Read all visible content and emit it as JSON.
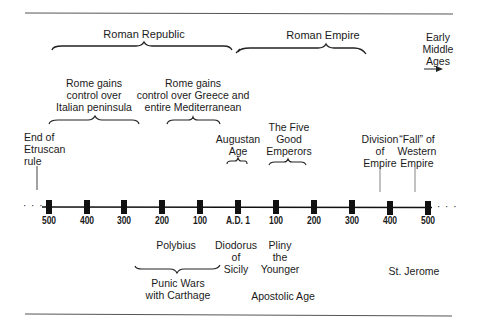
{
  "periods": {
    "roman_republic": "Roman Republic",
    "roman_empire": "Roman Empire",
    "early_middle_ages": "Early\nMiddle\nAges"
  },
  "events_above": {
    "italian_peninsula": "Rome gains\ncontrol over\nItalian peninsula",
    "greece_mediterranean": "Rome gains\ncontrol over Greece and\nentire Mediterranean",
    "etruscan": "End of\nEtruscan\nrule",
    "augustan_age": "Augustan\nAge",
    "five_good_emperors": "The Five\nGood\nEmperors",
    "division_empire": "Division\nof\nEmpire",
    "fall_western_empire": "“Fall” of\nWestern\nEmpire"
  },
  "ticks": [
    "500",
    "400",
    "300",
    "200",
    "100",
    "A.D. 1",
    "100",
    "200",
    "300",
    "400",
    "500"
  ],
  "events_below": {
    "polybius": "Polybius",
    "diodorus": "Diodorus\nof\nSicily",
    "pliny": "Pliny\nthe\nYounger",
    "st_jerome": "St. Jerome",
    "punic_wars": "Punic Wars\nwith Carthage",
    "apostolic_age": "Apostolic Age"
  },
  "ellipsis": "· · ·"
}
